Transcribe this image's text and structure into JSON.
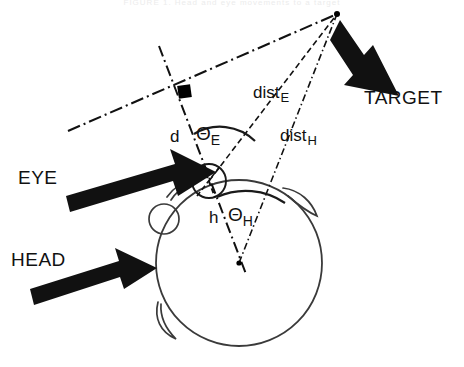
{
  "figure": {
    "caption_clipped": "FIGURE 1. Head and eye movements to a target",
    "colors": {
      "ink": "#111111",
      "background": "#ffffff",
      "arrow_fill": "#111111",
      "marker_fill": "#000000"
    },
    "labels": {
      "eye": "EYE",
      "head": "HEAD",
      "target": "TARGET",
      "d": "d",
      "h": "h",
      "theta_e_base": "Θ",
      "theta_e_sub": "E",
      "theta_h_base": "Θ",
      "theta_h_sub": "H",
      "dist_e_base": "dist",
      "dist_e_sub": "E",
      "dist_h_base": "dist",
      "dist_h_sub": "H"
    },
    "geometry": {
      "target_point": {
        "x": 337,
        "y": 14
      },
      "eye_point": {
        "x": 209,
        "y": 181
      },
      "head_center": {
        "x": 239,
        "y": 263
      },
      "square_marker": {
        "x": 184,
        "y": 91
      },
      "head_radius": 83,
      "eye_radius": 17,
      "other_eye": {
        "x": 164,
        "y": 219,
        "r": 15
      }
    },
    "elements": [
      "eye-gaze-axis-line",
      "perpendicular-dash-dot-line",
      "dist-e-line",
      "dist-h-line",
      "theta-e-arc",
      "theta-h-arc",
      "eye-arrow",
      "head-arrow",
      "target-arrow",
      "head-outline",
      "eye-circle",
      "left-ear-arc",
      "right-ear-arc",
      "bottom-ear-arc"
    ]
  }
}
